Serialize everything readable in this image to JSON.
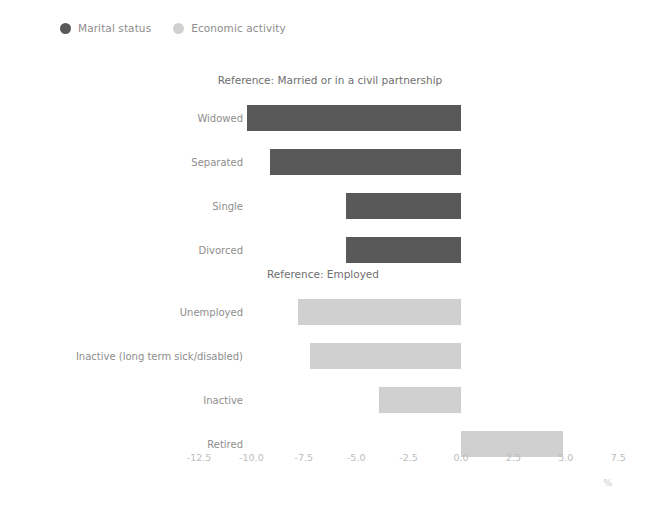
{
  "legend": {
    "items": [
      {
        "label": "Marital status",
        "color": "#595959",
        "icon": "filled-circle-icon"
      },
      {
        "label": "Economic activity",
        "color": "#d0d0d0",
        "icon": "filled-circle-icon"
      }
    ]
  },
  "axis": {
    "x_label": "%",
    "ticks": [
      "-12.5",
      "-10.0",
      "-7.5",
      "-5.0",
      "-2.5",
      "0.0",
      "2.5",
      "5.0",
      "7.5"
    ]
  },
  "chart_data": {
    "type": "bar",
    "orientation": "horizontal",
    "title": "",
    "xlabel": "%",
    "ylabel": "",
    "xlim": [
      -13.75,
      8.75
    ],
    "xticks": [
      -12.5,
      -10.0,
      -7.5,
      -5.0,
      -2.5,
      0.0,
      2.5,
      5.0,
      7.5
    ],
    "grid": false,
    "legend_position": "top-left",
    "panels": [
      {
        "title": "Reference: Married or in a civil partnership",
        "series_name": "Marital status",
        "color": "#595959",
        "categories": [
          "Widowed",
          "Separated",
          "Single",
          "Divorced"
        ],
        "values": [
          -10.2,
          -9.1,
          -5.5,
          -5.5
        ]
      },
      {
        "title": "Reference: Employed",
        "series_name": "Economic activity",
        "color": "#d0d0d0",
        "categories": [
          "Unemployed",
          "Inactive (long term sick/disabled)",
          "Inactive",
          "Retired"
        ],
        "values": [
          -7.8,
          -7.2,
          -3.9,
          4.85
        ]
      }
    ]
  }
}
